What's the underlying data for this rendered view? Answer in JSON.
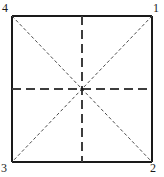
{
  "figure": {
    "type": "geometric-diagram",
    "stroke_color": "#1a1a1a",
    "dashed_color": "#444444",
    "background_color": "#ffffff",
    "square": {
      "left": 12,
      "top": 16,
      "right": 152,
      "bottom": 162
    },
    "center": {
      "x": 82,
      "y": 89
    },
    "corner_labels": [
      {
        "id": "1",
        "text": "1",
        "position": "top-right"
      },
      {
        "id": "2",
        "text": "2",
        "position": "bottom-right"
      },
      {
        "id": "3",
        "text": "3",
        "position": "bottom-left"
      },
      {
        "id": "4",
        "text": "4",
        "position": "top-left"
      }
    ],
    "lines": {
      "solid_edges": [
        {
          "name": "top-edge",
          "x1": 12,
          "y1": 16,
          "x2": 152,
          "y2": 16
        },
        {
          "name": "right-edge",
          "x1": 152,
          "y1": 16,
          "x2": 152,
          "y2": 162
        },
        {
          "name": "bottom-edge",
          "x1": 152,
          "y1": 162,
          "x2": 12,
          "y2": 162
        },
        {
          "name": "left-edge",
          "x1": 12,
          "y1": 162,
          "x2": 12,
          "y2": 16
        }
      ],
      "dashed_center": [
        {
          "name": "horizontal-centerline",
          "x1": 12,
          "y1": 89,
          "x2": 152,
          "y2": 89
        },
        {
          "name": "vertical-centerline",
          "x1": 82,
          "y1": 16,
          "x2": 82,
          "y2": 162
        }
      ],
      "dashed_diagonals": [
        {
          "name": "diagonal-4-to-2",
          "x1": 12,
          "y1": 16,
          "x2": 152,
          "y2": 162
        },
        {
          "name": "diagonal-1-to-3",
          "x1": 152,
          "y1": 16,
          "x2": 12,
          "y2": 162
        }
      ]
    }
  }
}
